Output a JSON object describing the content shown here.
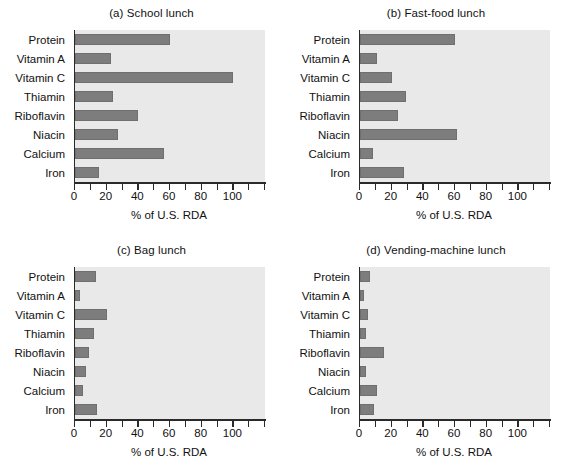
{
  "figure": {
    "name": "nutrient-content-of-four-lunch-types",
    "categories": [
      "Protein",
      "Vitamin A",
      "Vitamin C",
      "Thiamin",
      "Riboflavin",
      "Niacin",
      "Calcium",
      "Iron"
    ],
    "axis_title": "% of U.S. RDA",
    "xlim": [
      0,
      120
    ],
    "xticks_major": [
      0,
      20,
      40,
      60,
      80,
      100
    ],
    "xticks_minor": [
      10,
      30,
      50,
      70,
      90,
      110,
      120
    ],
    "xtick_labels": [
      "0",
      "20",
      "40",
      "60",
      "80",
      "100"
    ],
    "bar_color": "#7d7d7d",
    "plot_background": "#e9e9e9",
    "axis_color": "#2a2a2a"
  },
  "panels": [
    {
      "id": "a",
      "title": "(a) School lunch",
      "values": [
        60,
        23,
        100,
        24,
        40,
        27,
        56,
        15
      ]
    },
    {
      "id": "b",
      "title": "(b) Fast-food lunch",
      "values": [
        60,
        11,
        20,
        29,
        24,
        61,
        8,
        28
      ]
    },
    {
      "id": "c",
      "title": "(c) Bag lunch",
      "values": [
        13,
        3,
        20,
        12,
        9,
        7,
        5,
        14
      ]
    },
    {
      "id": "d",
      "title": "(d) Vending-machine lunch",
      "values": [
        6,
        2.5,
        5,
        4,
        15,
        3.5,
        11,
        9
      ]
    }
  ],
  "chart_data": {
    "type": "bar",
    "orientation": "horizontal",
    "xlabel": "% of U.S. RDA",
    "ylabel": "",
    "xlim": [
      0,
      120
    ],
    "grid": false,
    "legend": "none",
    "categories": [
      "Protein",
      "Vitamin A",
      "Vitamin C",
      "Thiamin",
      "Riboflavin",
      "Niacin",
      "Calcium",
      "Iron"
    ],
    "subplots": [
      {
        "panel": "a",
        "title": "(a) School lunch",
        "type": "bar",
        "xlabel": "% of U.S. RDA",
        "xlim": [
          0,
          120
        ],
        "categories": [
          "Protein",
          "Vitamin A",
          "Vitamin C",
          "Thiamin",
          "Riboflavin",
          "Niacin",
          "Calcium",
          "Iron"
        ],
        "values": [
          60,
          23,
          100,
          24,
          40,
          27,
          56,
          15
        ]
      },
      {
        "panel": "b",
        "title": "(b) Fast-food lunch",
        "type": "bar",
        "xlabel": "% of U.S. RDA",
        "xlim": [
          0,
          120
        ],
        "categories": [
          "Protein",
          "Vitamin A",
          "Vitamin C",
          "Thiamin",
          "Riboflavin",
          "Niacin",
          "Calcium",
          "Iron"
        ],
        "values": [
          60,
          11,
          20,
          29,
          24,
          61,
          8,
          28
        ]
      },
      {
        "panel": "c",
        "title": "(c) Bag lunch",
        "type": "bar",
        "xlabel": "% of U.S. RDA",
        "xlim": [
          0,
          120
        ],
        "categories": [
          "Protein",
          "Vitamin A",
          "Vitamin C",
          "Thiamin",
          "Riboflavin",
          "Niacin",
          "Calcium",
          "Iron"
        ],
        "values": [
          13,
          3,
          20,
          12,
          9,
          7,
          5,
          14
        ]
      },
      {
        "panel": "d",
        "title": "(d) Vending-machine lunch",
        "type": "bar",
        "xlabel": "% of U.S. RDA",
        "xlim": [
          0,
          120
        ],
        "categories": [
          "Protein",
          "Vitamin A",
          "Vitamin C",
          "Thiamin",
          "Riboflavin",
          "Niacin",
          "Calcium",
          "Iron"
        ],
        "values": [
          6,
          2.5,
          5,
          4,
          15,
          3.5,
          11,
          9
        ]
      }
    ]
  }
}
